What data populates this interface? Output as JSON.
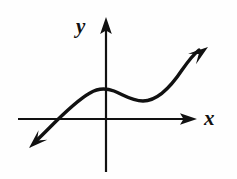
{
  "figure": {
    "background_color": "#fefefe",
    "ink_color": "#111111",
    "axes": {
      "x_label": "x",
      "y_label": "y",
      "x_axis_line": {
        "x1": 18,
        "y1": 119,
        "x2": 190,
        "y2": 119
      },
      "y_axis_line": {
        "x1": 106,
        "y1": 24,
        "x2": 106,
        "y2": 172
      },
      "x_axis_arrow_tip": {
        "x": 197,
        "y": 119
      },
      "y_axis_arrow_tip": {
        "x": 106,
        "y": 17
      },
      "origin": {
        "x": 106,
        "y": 119
      },
      "stroke_width": 2.2
    },
    "curve": {
      "stroke_width": 3.4,
      "description": "increasing cubic with a local maximum left of the y-axis and a local minimum right of it",
      "start_arrow_tip": {
        "x": 29,
        "y": 148
      },
      "end_arrow_tip": {
        "x": 208,
        "y": 47
      },
      "x_intercept": {
        "x": 55,
        "y": 119
      },
      "local_maximum": {
        "x": 100,
        "y": 90
      },
      "local_minimum": {
        "x": 143,
        "y": 101
      },
      "path": "M 36 141 C 52 126, 72 103, 90 93 C 98 88, 106 88, 114 91 C 124 95, 132 101, 143 101 C 157 101, 170 88, 182 70 C 189 60, 194 54, 199 50"
    }
  }
}
